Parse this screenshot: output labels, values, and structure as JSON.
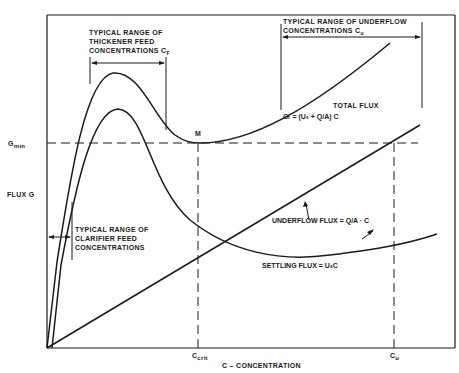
{
  "diagram": {
    "type": "solids flux curve (thickener design)",
    "axes": {
      "y_label": "FLUX G",
      "x_label": "C–CONCENTRATION",
      "y_marks": [
        "G_min"
      ],
      "x_marks": [
        "C_crit",
        "C_u"
      ]
    },
    "labels": {
      "gmin": "G",
      "gmin_sub": "min",
      "flux_g": "FLUX G",
      "x_axis": "C – CONCENTRATION",
      "ccrit": "C",
      "ccrit_sub": "crit",
      "cu": "C",
      "cu_sub": "u",
      "point_m": "M",
      "thickener_range": "TYPICAL RANGE OF\nTHICKENER FEED\nCONCENTRATIONS C",
      "thickener_range_sub": "F",
      "underflow_range_line1": "TYPICAL RANGE OF UNDERFLOW",
      "underflow_range_line2": "CONCENTRATIONS C",
      "underflow_range_sub": "u",
      "clarifier_range": "TYPICAL RANGE OF\nCLARIFIER FEED\nCONCENTRATIONS",
      "total_flux": "TOTAL FLUX",
      "total_flux_eq": "Gₜ = (Uₛ + Q/A) C",
      "underflow_flux": "UNDERFLOW FLUX = Q/A · C",
      "settling_flux": "SETTLING FLUX = UₛC"
    },
    "curves": [
      {
        "name": "Total flux",
        "description": "rises steeply to a peak, dips to minimum M at C_crit (G_min), then rises again"
      },
      {
        "name": "Settling flux",
        "description": "rises steeply to a peak, then decays with increasing concentration, slight rise at high C"
      },
      {
        "name": "Underflow flux",
        "description": "straight line through origin with slope Q/A"
      }
    ],
    "colors": {
      "ink": "#1a1a1a",
      "background": "#ffffff"
    }
  }
}
